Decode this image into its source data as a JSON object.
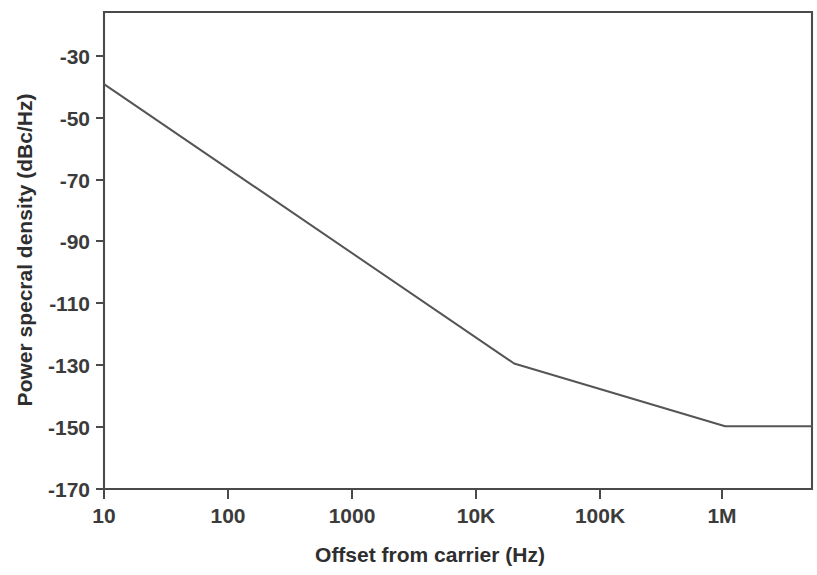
{
  "chart_data": {
    "type": "line",
    "title": "",
    "xlabel": "Offset from carrier (Hz)",
    "ylabel": "Power specral density (dBc/Hz)",
    "xscale": "log",
    "yscale": "linear",
    "xlim": [
      10,
      5000000
    ],
    "ylim": [
      -170,
      -18
    ],
    "grid": false,
    "legend": false,
    "x_tick_labels": [
      "10",
      "100",
      "1000",
      "10K",
      "100K",
      "1M"
    ],
    "x_tick_values": [
      10,
      100,
      1000,
      10000,
      100000,
      1000000
    ],
    "y_tick_labels": [
      "-30",
      "-50",
      "-70",
      "-90",
      "-110",
      "-130",
      "-150",
      "-170"
    ],
    "y_tick_values": [
      -30,
      -50,
      -70,
      -90,
      -110,
      -130,
      -150,
      -170
    ],
    "series": [
      {
        "name": "Phase noise",
        "color": "#555555",
        "x": [
          10,
          20000,
          1000000,
          5000000
        ],
        "y": [
          -41,
          -130,
          -150,
          -150
        ]
      }
    ],
    "annotations": []
  },
  "axes": {
    "x_title": "Offset from carrier (Hz)",
    "y_title": "Power specral density (dBc/Hz)"
  },
  "colors": {
    "background": "#ffffff",
    "axis": "#4a4a4a",
    "curve": "#555555",
    "text": "#3b3b3b"
  }
}
